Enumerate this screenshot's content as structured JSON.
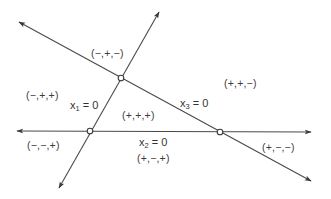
{
  "diagram": {
    "title": "",
    "lines": [
      {
        "id": "x1",
        "label_var": "x",
        "label_sub": "1",
        "label_rest": " = 0",
        "from": [
          59,
          188
        ],
        "to": [
          159,
          12
        ]
      },
      {
        "id": "x2",
        "label_var": "x",
        "label_sub": "2",
        "label_rest": " = 0",
        "from": [
          311,
          132
        ],
        "to": [
          17,
          131
        ]
      },
      {
        "id": "x3",
        "label_var": "x",
        "label_sub": "3",
        "label_rest": " = 0",
        "from": [
          311,
          181
        ],
        "to": [
          19,
          22
        ]
      }
    ],
    "vertices": [
      {
        "id": "v13",
        "x": 121,
        "y": 78
      },
      {
        "id": "v12",
        "x": 90,
        "y": 131
      },
      {
        "id": "v23",
        "x": 220,
        "y": 132
      }
    ],
    "regions": [
      {
        "id": "r1",
        "sign": "(−,+,−)",
        "x": 91,
        "y": 48
      },
      {
        "id": "r2",
        "sign": "(+,+,−)",
        "x": 224,
        "y": 78
      },
      {
        "id": "r3",
        "sign": "(−,+,+)",
        "x": 26,
        "y": 90
      },
      {
        "id": "r4",
        "sign": "(+,+,+)",
        "x": 122,
        "y": 110
      },
      {
        "id": "r5",
        "sign": "(−,−,+)",
        "x": 27,
        "y": 140
      },
      {
        "id": "r6",
        "sign": "(+,−,+)",
        "x": 137,
        "y": 153
      },
      {
        "id": "r7",
        "sign": "(+,−,−)",
        "x": 262,
        "y": 142
      }
    ],
    "equations": [
      {
        "id": "eq1",
        "var": "x",
        "sub": "1",
        "rest": " = 0",
        "x": 70,
        "y": 100
      },
      {
        "id": "eq2",
        "var": "x",
        "sub": "2",
        "rest": " = 0",
        "x": 139,
        "y": 137
      },
      {
        "id": "eq3",
        "var": "x",
        "sub": "3",
        "rest": " = 0",
        "x": 180,
        "y": 98
      }
    ],
    "colors": {
      "line": "#4a4a4a",
      "text": "#3c3c3c",
      "background": "#ffffff"
    }
  }
}
